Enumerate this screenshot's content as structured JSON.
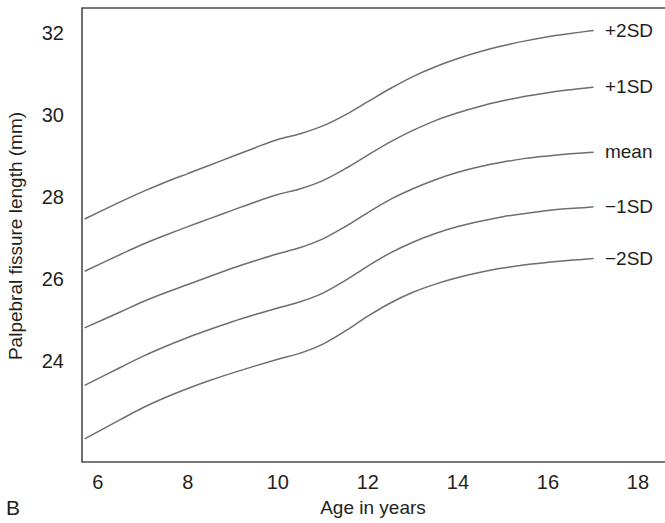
{
  "panel": {
    "label": "B"
  },
  "colors": {
    "line": "#6e6e6e",
    "axis": "#4d4d4d",
    "text": "#231f20",
    "background": "#ffffff"
  },
  "chart_data": {
    "type": "line",
    "title": "",
    "subtitle": "",
    "xlabel": "Age in years",
    "ylabel": "Palpebral fissure length (mm)",
    "xlim": [
      5.65,
      18.6
    ],
    "ylim": [
      21.55,
      32.6
    ],
    "xticks": [
      6,
      8,
      10,
      12,
      14,
      16,
      18
    ],
    "xtick_labels": [
      "6",
      "8",
      "10",
      "12",
      "14",
      "16",
      "18"
    ],
    "yticks": [
      24,
      26,
      28,
      30,
      32
    ],
    "ytick_labels": [
      "24",
      "26",
      "28",
      "30",
      "32"
    ],
    "grid": false,
    "legend_position": "right-inline",
    "frame": "left-top-bottom",
    "x": [
      5.72,
      6.5,
      7.0,
      7.5,
      8.0,
      8.5,
      9.0,
      9.5,
      10.0,
      10.5,
      11.0,
      11.5,
      12.0,
      12.5,
      13.0,
      13.5,
      14.0,
      14.5,
      15.0,
      15.5,
      16.0,
      16.5,
      17.0
    ],
    "series": [
      {
        "name": "+2SD",
        "label": "+2SD",
        "values": [
          27.47,
          27.88,
          28.13,
          28.36,
          28.57,
          28.78,
          28.99,
          29.2,
          29.4,
          29.54,
          29.73,
          30.0,
          30.32,
          30.64,
          30.93,
          31.17,
          31.37,
          31.54,
          31.68,
          31.8,
          31.9,
          31.98,
          32.05
        ]
      },
      {
        "name": "+1SD",
        "label": "+1SD",
        "values": [
          26.2,
          26.6,
          26.85,
          27.07,
          27.28,
          27.48,
          27.68,
          27.88,
          28.06,
          28.2,
          28.4,
          28.69,
          29.02,
          29.34,
          29.62,
          29.86,
          30.05,
          30.21,
          30.34,
          30.45,
          30.54,
          30.61,
          30.67
        ]
      },
      {
        "name": "mean",
        "label": "mean",
        "values": [
          24.82,
          25.2,
          25.45,
          25.67,
          25.87,
          26.07,
          26.27,
          26.45,
          26.62,
          26.77,
          26.98,
          27.28,
          27.62,
          27.94,
          28.2,
          28.42,
          28.6,
          28.74,
          28.85,
          28.94,
          29.0,
          29.05,
          29.09
        ]
      },
      {
        "name": "-1SD",
        "label": "−1SD",
        "values": [
          23.42,
          23.85,
          24.12,
          24.36,
          24.58,
          24.78,
          24.97,
          25.14,
          25.3,
          25.45,
          25.66,
          25.97,
          26.32,
          26.64,
          26.9,
          27.11,
          27.28,
          27.41,
          27.52,
          27.6,
          27.67,
          27.72,
          27.76
        ]
      },
      {
        "name": "-2SD",
        "label": "−2SD",
        "values": [
          22.12,
          22.58,
          22.87,
          23.12,
          23.34,
          23.54,
          23.72,
          23.89,
          24.05,
          24.2,
          24.42,
          24.74,
          25.1,
          25.42,
          25.68,
          25.88,
          26.04,
          26.17,
          26.27,
          26.35,
          26.41,
          26.46,
          26.5
        ]
      }
    ]
  }
}
